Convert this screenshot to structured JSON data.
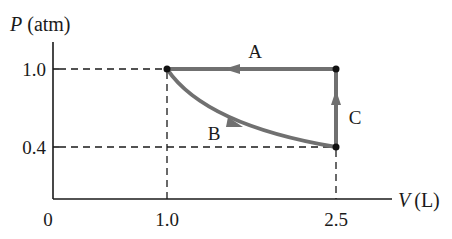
{
  "diagram": {
    "type": "pv-diagram",
    "y_axis": {
      "label_symbol": "P",
      "label_unit": "(atm)",
      "ticks": [
        "1.0",
        "0.4"
      ]
    },
    "x_axis": {
      "label_symbol": "V",
      "label_unit": "(L)",
      "ticks": [
        "0",
        "1.0",
        "2.5"
      ]
    },
    "points": [
      {
        "V": 1.0,
        "P": 1.0
      },
      {
        "V": 2.5,
        "P": 1.0
      },
      {
        "V": 2.5,
        "P": 0.4
      }
    ],
    "processes": [
      {
        "label": "A",
        "from": {
          "V": 2.5,
          "P": 1.0
        },
        "to": {
          "V": 1.0,
          "P": 1.0
        },
        "shape": "straight-horizontal"
      },
      {
        "label": "B",
        "from": {
          "V": 1.0,
          "P": 1.0
        },
        "to": {
          "V": 2.5,
          "P": 0.4
        },
        "shape": "curved"
      },
      {
        "label": "C",
        "from": {
          "V": 2.5,
          "P": 0.4
        },
        "to": {
          "V": 2.5,
          "P": 1.0
        },
        "shape": "straight-vertical"
      }
    ],
    "colors": {
      "path": "#707070",
      "axis": "#1a1a1a",
      "points": "#111111"
    }
  }
}
